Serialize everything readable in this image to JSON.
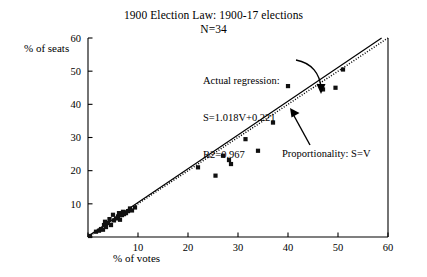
{
  "title": {
    "main": "1900 Election Law: 1900-17 elections",
    "sample_size": "N=34"
  },
  "axes": {
    "xlabel": "% of votes",
    "ylabel": "% of seats",
    "xticks": [
      "10",
      "20",
      "30",
      "40",
      "50",
      "60"
    ],
    "yticks": [
      "10",
      "20",
      "30",
      "40",
      "50",
      "60"
    ]
  },
  "annotations": {
    "regression": "Actual regression:\nS=1.018V+0.221\nR2=0.967",
    "regression_line1": "Actual regression:",
    "regression_line2": "S=1.018V+0.221",
    "regression_line3": "R2=0.967",
    "proportionality": "Proportionality: S=V"
  },
  "colors": {
    "ink": "#000000",
    "background": "#ffffff",
    "marker": "#101010"
  },
  "chart_data": {
    "type": "scatter",
    "title": "1900 Election Law: 1900-17 elections",
    "subtitle": "N=34",
    "xlabel": "% of votes",
    "ylabel": "% of seats",
    "xlim": [
      0,
      60
    ],
    "ylim": [
      0,
      60
    ],
    "xticks": [
      0,
      10,
      20,
      30,
      40,
      50,
      60
    ],
    "yticks": [
      0,
      10,
      20,
      30,
      40,
      50,
      60
    ],
    "grid": false,
    "legend": "none",
    "n": 34,
    "points": [
      [
        0.4,
        0.3
      ],
      [
        1.6,
        1.6
      ],
      [
        2.2,
        1.9
      ],
      [
        2.6,
        2.4
      ],
      [
        3.0,
        2.2
      ],
      [
        3.2,
        3.6
      ],
      [
        3.4,
        4.6
      ],
      [
        3.6,
        3.0
      ],
      [
        4.0,
        4.2
      ],
      [
        4.3,
        5.4
      ],
      [
        4.6,
        3.6
      ],
      [
        5.0,
        6.7
      ],
      [
        5.2,
        5.0
      ],
      [
        5.6,
        5.6
      ],
      [
        6.0,
        6.2
      ],
      [
        6.2,
        7.2
      ],
      [
        6.4,
        5.2
      ],
      [
        6.8,
        6.6
      ],
      [
        7.0,
        7.6
      ],
      [
        7.2,
        6.9
      ],
      [
        7.6,
        7.2
      ],
      [
        8.0,
        7.8
      ],
      [
        8.4,
        8.6
      ],
      [
        8.8,
        8.0
      ],
      [
        9.4,
        8.9
      ],
      [
        22.0,
        21.0
      ],
      [
        25.5,
        18.5
      ],
      [
        27.0,
        24.5
      ],
      [
        28.2,
        23.2
      ],
      [
        28.6,
        22.0
      ],
      [
        31.5,
        29.5
      ],
      [
        34.0,
        26.0
      ],
      [
        37.0,
        34.5
      ],
      [
        40.0,
        45.5
      ],
      [
        47.0,
        44.5
      ],
      [
        49.5,
        45.0
      ],
      [
        51.0,
        50.5
      ]
    ],
    "series": [
      {
        "name": "Actual regression",
        "type": "line",
        "style": "solid",
        "equation": "S=1.018V+0.221",
        "slope": 1.018,
        "intercept": 0.221,
        "r_squared": 0.967
      },
      {
        "name": "Proportionality",
        "type": "line",
        "style": "dotted",
        "equation": "S=V",
        "slope": 1.0,
        "intercept": 0.0
      }
    ]
  }
}
